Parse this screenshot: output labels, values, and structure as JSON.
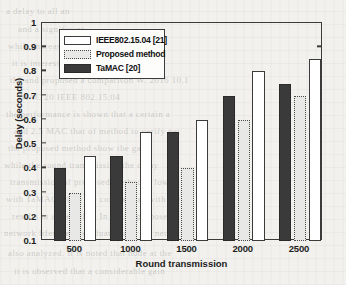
{
  "chart_data": {
    "type": "bar",
    "title": "",
    "xlabel": "Round transmission",
    "ylabel": "Delay (seconds)",
    "categories": [
      "500",
      "1000",
      "1500",
      "2000",
      "2500"
    ],
    "series": [
      {
        "name": "TaMAC [20]",
        "values": [
          0.4,
          0.45,
          0.55,
          0.7,
          0.75
        ]
      },
      {
        "name": "Proposed method",
        "values": [
          0.3,
          0.345,
          0.4,
          0.6,
          0.7
        ]
      },
      {
        "name": "IEEE802.15.04 [21]",
        "values": [
          0.45,
          0.55,
          0.6,
          0.8,
          0.85
        ]
      }
    ],
    "ylim": [
      0.1,
      1.0
    ],
    "yticks": [
      "0.1",
      "0.2",
      "0.3",
      "0.4",
      "0.5",
      "0.6",
      "0.7",
      "0.8",
      "0.9",
      "1"
    ],
    "ytick_values": [
      0.1,
      0.2,
      0.3,
      0.4,
      0.5,
      0.6,
      0.7,
      0.8,
      0.9,
      1.0
    ],
    "grid": false,
    "legend_position": "upper-left",
    "legend_entries": [
      {
        "label": "IEEE802.15.04 [21]",
        "style": "white-filled"
      },
      {
        "label": "Proposed method",
        "style": "dotted-light"
      },
      {
        "label": "TaMAC [20]",
        "style": "dark-filled"
      }
    ],
    "colors": {
      "ieee": "#ffffff",
      "proposed": "#e8e8e6",
      "tamac": "#3a3a3a",
      "axis": "#3b3b3b",
      "background": "#f2f1ee"
    }
  },
  "background_text": {
    "lines": [
      "a delay to all an",
      "and a significant",
      "while increased w",
      "it is interested",
      "the and proposed a comparison W. 2016 10.1",
      "MAC 20 IEEE 802.15.04",
      "the performance is shown that a certain a",
      "and 2.5 MAC that of method to verify net",
      "the proposed method show the gain",
      "while the round transmission the delay",
      "transmission of proposed method is low",
      "with TaMAC while the comparison with the",
      "results in a the delay. In of the proposed",
      "network lifetime is evaluated and the netw",
      "also analyzed. It is noted that node at the",
      "it is observed that a considerable gain"
    ]
  }
}
